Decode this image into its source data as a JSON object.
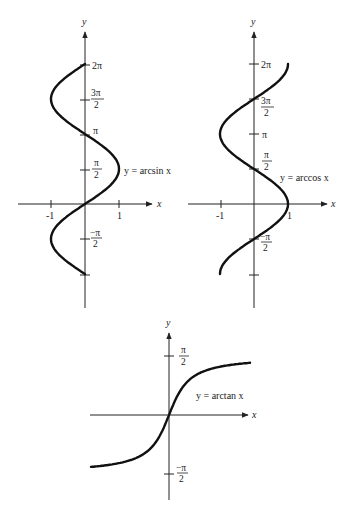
{
  "chart_data": [
    {
      "type": "line",
      "title": "",
      "xlabel": "x",
      "ylabel": "y",
      "function": "x = sin y",
      "label": "y = arcsin x",
      "xlim": [
        -1,
        1
      ],
      "ylim": [
        -3.1416,
        6.2832
      ],
      "x_ticks": [
        "-1",
        "1"
      ],
      "y_ticks": [
        "2π",
        "3π/2",
        "π",
        "π/2",
        "-π/2",
        ""
      ],
      "y_tick_values": [
        6.2832,
        4.7124,
        3.1416,
        1.5708,
        -1.5708,
        -3.1416
      ],
      "samples": {
        "y": [
          -3.1416,
          -1.5708,
          0,
          1.5708,
          3.1416,
          4.7124,
          6.2832
        ],
        "x": [
          0,
          -1,
          0,
          1,
          0,
          -1,
          0
        ]
      },
      "grid": false
    },
    {
      "type": "line",
      "title": "",
      "xlabel": "x",
      "ylabel": "y",
      "function": "x = cos y",
      "label": "y = arccos x",
      "xlim": [
        -1,
        1
      ],
      "ylim": [
        -3.1416,
        6.2832
      ],
      "x_ticks": [
        "-1",
        "1"
      ],
      "y_ticks": [
        "2π",
        "3π/2",
        "π",
        "π/2",
        "-π/2",
        ""
      ],
      "y_tick_values": [
        6.2832,
        4.7124,
        3.1416,
        1.5708,
        -1.5708,
        -3.1416
      ],
      "samples": {
        "y": [
          -3.1416,
          -1.5708,
          0,
          1.5708,
          3.1416,
          4.7124,
          6.2832
        ],
        "x": [
          -1,
          0,
          1,
          0,
          -1,
          0,
          1
        ]
      },
      "grid": false
    },
    {
      "type": "line",
      "title": "",
      "xlabel": "x",
      "ylabel": "y",
      "function": "y = arctan x",
      "label": "y = arctan x",
      "xlim": [
        -5.2,
        5.4
      ],
      "ylim": [
        -1.5708,
        1.5708
      ],
      "y_ticks": [
        "π/2",
        "-π/2"
      ],
      "y_tick_values": [
        1.5708,
        -1.5708
      ],
      "samples": {
        "x": [
          -5.2,
          -2,
          -1,
          0,
          1,
          2,
          5.4
        ],
        "y": [
          -1.381,
          -1.107,
          -0.785,
          0,
          0.785,
          1.107,
          1.387
        ]
      },
      "grid": false
    }
  ],
  "labels": {
    "axis_x": "x",
    "axis_y": "y",
    "arcsin": "y = arcsin x",
    "arccos": "y = arccos x",
    "arctan": "y = arctan x",
    "two_pi": "2π",
    "pi": "π",
    "pi_num": "π",
    "three_pi_num": "3π",
    "neg_pi_num": "−π",
    "den_2": "2",
    "neg_one": "-1",
    "one": "1"
  },
  "layout": {
    "p1": {
      "ox": 85,
      "oy": 204,
      "sx": 34,
      "sy": 22.28
    },
    "p2": {
      "ox": 254,
      "oy": 204,
      "sx": 34,
      "sy": 22.28
    },
    "p3": {
      "ox": 169,
      "oy": 415,
      "sx": 15,
      "sy": 37.6
    }
  }
}
